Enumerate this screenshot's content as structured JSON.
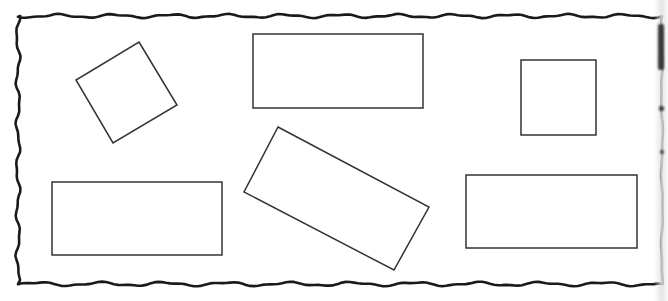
{
  "figure": {
    "width": 668,
    "height": 301,
    "background": "#ffffff",
    "stroke_color": "#333333",
    "border_color": "#1a1a1a",
    "border": {
      "style": "hand-drawn-wavy",
      "top_y": 16,
      "bottom_y": 284,
      "left_x": 18,
      "right_x": 662
    },
    "shapes": [
      {
        "id": "tilted-square",
        "kind": "polygon",
        "points": [
          [
            139,
            42
          ],
          [
            177,
            105
          ],
          [
            113,
            143
          ],
          [
            76,
            80
          ]
        ]
      },
      {
        "id": "top-center-rectangle",
        "kind": "rect",
        "x": 253,
        "y": 34,
        "w": 170,
        "h": 74
      },
      {
        "id": "top-right-square",
        "kind": "rect",
        "x": 521,
        "y": 60,
        "w": 75,
        "h": 75
      },
      {
        "id": "bottom-left-rectangle",
        "kind": "rect",
        "x": 52,
        "y": 182,
        "w": 170,
        "h": 73
      },
      {
        "id": "tilted-rectangle",
        "kind": "polygon",
        "points": [
          [
            278,
            127
          ],
          [
            429,
            207
          ],
          [
            394,
            270
          ],
          [
            244,
            192
          ]
        ]
      },
      {
        "id": "bottom-right-rectangle",
        "kind": "rect",
        "x": 466,
        "y": 175,
        "w": 171,
        "h": 73
      }
    ]
  }
}
